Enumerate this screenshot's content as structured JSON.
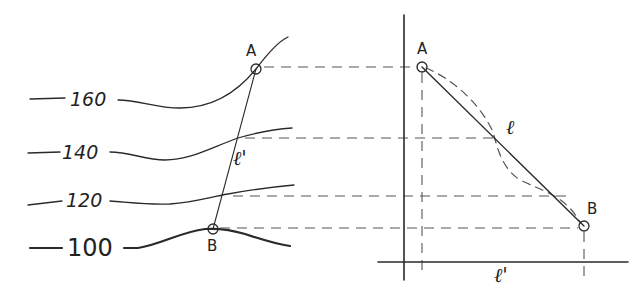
{
  "diagram": {
    "type": "contour-map-profile",
    "stroke_color": "#2a2a2a",
    "dash_color": "#555555",
    "contours": [
      {
        "label": "160",
        "y": 101
      },
      {
        "label": "140",
        "y": 153
      },
      {
        "label": "120",
        "y": 201
      },
      {
        "label": "100",
        "y": 248,
        "emphasized": true
      }
    ],
    "points": {
      "A": {
        "label": "A"
      },
      "B": {
        "label": "B"
      }
    },
    "lines": {
      "plan_segment": {
        "label": "ℓ'"
      },
      "profile_segment": {
        "label": "ℓ"
      },
      "baseline_length": {
        "label": "ℓ'"
      }
    }
  }
}
